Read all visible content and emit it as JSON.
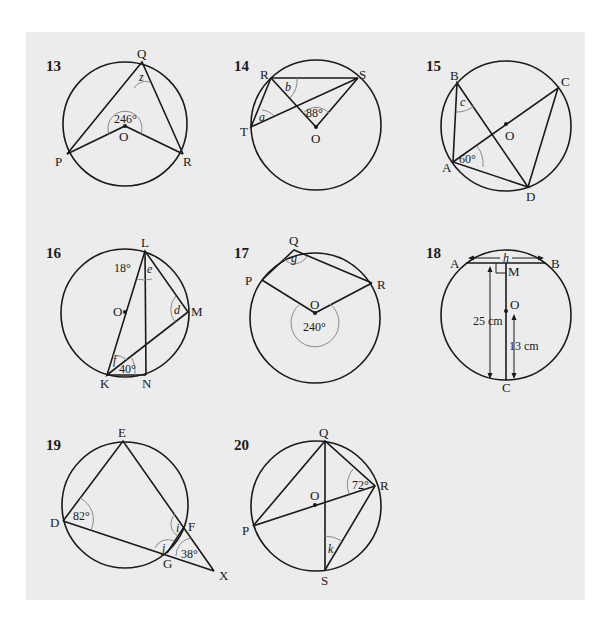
{
  "exercises": [
    {
      "number": "13",
      "points": {
        "Q": "Q",
        "P": "P",
        "R": "R",
        "O": "O"
      },
      "given_angle": "246°",
      "unknown": "z"
    },
    {
      "number": "14",
      "points": {
        "R": "R",
        "S": "S",
        "T": "T",
        "O": "O"
      },
      "given_angle": "88°",
      "unknowns": [
        "a",
        "b"
      ]
    },
    {
      "number": "15",
      "points": {
        "B": "B",
        "C": "C",
        "A": "A",
        "D": "D",
        "O": "O"
      },
      "given_angle": "60°",
      "unknown": "c"
    },
    {
      "number": "16",
      "points": {
        "L": "L",
        "M": "M",
        "O": "O",
        "K": "K",
        "N": "N"
      },
      "given_angles": [
        "18°",
        "40°"
      ],
      "unknowns": [
        "e",
        "d",
        "f"
      ]
    },
    {
      "number": "17",
      "points": {
        "Q": "Q",
        "P": "P",
        "R": "R",
        "O": "O"
      },
      "given_angle": "240°",
      "unknown": "g"
    },
    {
      "number": "18",
      "points": {
        "A": "A",
        "B": "B",
        "M": "M",
        "O": "O",
        "C": "C"
      },
      "unknown": "h",
      "lengths": [
        "25 cm",
        "13 cm"
      ]
    },
    {
      "number": "19",
      "points": {
        "E": "E",
        "D": "D",
        "F": "F",
        "G": "G",
        "X": "X"
      },
      "given_angles": [
        "82°",
        "38°"
      ],
      "unknowns": [
        "i",
        "j"
      ]
    },
    {
      "number": "20",
      "points": {
        "Q": "Q",
        "P": "P",
        "R": "R",
        "O": "O",
        "S": "S"
      },
      "given_angle": "72°",
      "unknown": "k"
    }
  ]
}
